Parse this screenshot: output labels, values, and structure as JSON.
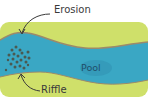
{
  "diagram": {
    "labels": {
      "erosion": "Erosion",
      "pool": "Pool",
      "riffle": "Riffle"
    },
    "colors": {
      "land": "#cfe06a",
      "water": "#3aa7c4",
      "bank": "#9c8a6a",
      "rocks": "#4a5a52",
      "text": "#3a3a3a"
    }
  }
}
